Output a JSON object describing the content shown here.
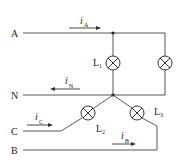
{
  "diagram": {
    "type": "three-phase four-wire circuit",
    "lines": [
      {
        "id": "A",
        "label": "A"
      },
      {
        "id": "N",
        "label": "N"
      },
      {
        "id": "C",
        "label": "C"
      },
      {
        "id": "B",
        "label": "B"
      }
    ],
    "currents": [
      {
        "id": "iA",
        "symbol": "i",
        "subscript": "A",
        "direction": "right"
      },
      {
        "id": "iN",
        "symbol": "i",
        "subscript": "N",
        "direction": "left"
      },
      {
        "id": "iC",
        "symbol": "i",
        "subscript": "C",
        "direction": "right"
      },
      {
        "id": "iB",
        "symbol": "i",
        "subscript": "B",
        "direction": "right"
      }
    ],
    "lamps": [
      {
        "id": "L1",
        "label": "L",
        "subscript": "1"
      },
      {
        "id": "L2",
        "label": "L",
        "subscript": "2"
      },
      {
        "id": "L3",
        "label": "L",
        "subscript": "3"
      },
      {
        "id": "Lx",
        "label": "",
        "subscript": ""
      }
    ]
  }
}
